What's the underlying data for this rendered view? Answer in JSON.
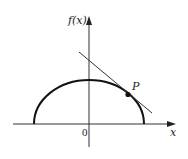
{
  "diagram": {
    "y_axis_label": "f(x)",
    "x_axis_label": "x",
    "origin_label": "0",
    "point_label": "P",
    "curve": "upper semi-ellipse",
    "tangent_line": "tangent to curve at P",
    "colors": {
      "stroke": "#111111",
      "axis": "#333333",
      "background": "#ffffff"
    }
  }
}
